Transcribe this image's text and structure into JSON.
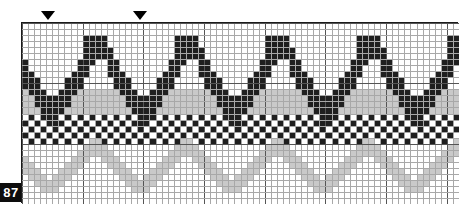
{
  "document": {
    "kind": "cross-stitch-pattern-chart",
    "page_badge": "87"
  },
  "chart_frame": {
    "x": 21,
    "y": 22,
    "width": 437,
    "height": 181,
    "columns": 72,
    "rows": 30,
    "cell_px": 6.07,
    "border_color": "#1a1a1a",
    "grid_line_color": "#a8a8a8",
    "heavy_line_color": "#555555",
    "heavy_every": 10,
    "background": "#ffffff"
  },
  "repeat_markers": [
    {
      "name": "repeat-marker-1",
      "x": 48,
      "column": 4
    },
    {
      "name": "repeat-marker-2",
      "x": 140,
      "column": 19
    }
  ],
  "palette": {
    "dark": "#1f1f1f",
    "mid": "#9a9a9a",
    "light": "#c9c9c9",
    "empty": "#ffffff"
  },
  "chart_data": {
    "type": "heatmap",
    "title": "",
    "xlabel": "",
    "ylabel": "",
    "columns": 72,
    "rows": 30,
    "legend": [
      {
        "symbol": "dark",
        "color": "#1f1f1f",
        "label": "dark floss"
      },
      {
        "symbol": "light",
        "color": "#c9c9c9",
        "label": "light floss"
      },
      {
        "symbol": "mid",
        "color": "#9a9a9a",
        "label": "medium floss"
      },
      {
        "symbol": "empty",
        "color": "#ffffff",
        "label": "unstitched"
      }
    ],
    "motifs": [
      {
        "name": "dark-chevron-wave",
        "color": "dark",
        "repeat_period": 15,
        "repeats": 5,
        "phase": -11,
        "band_top": 1,
        "band_bottom": 17,
        "peak_row": 2,
        "valley_row": 14,
        "stroke_rows": 3,
        "flat_top_cells": 3
      },
      {
        "name": "light-fill-band",
        "color": "light",
        "row_start": 11,
        "row_end": 14,
        "under_chevron": true
      },
      {
        "name": "dark-checker-band",
        "color": "dark",
        "row_start": 15,
        "row_end": 19,
        "checker_parity": 0
      },
      {
        "name": "light-zigzag-wave",
        "color": "light",
        "repeat_period": 15,
        "repeats": 5,
        "phase": -4,
        "peak_row": 19,
        "valley_row": 27,
        "stroke_rows": 2
      }
    ]
  }
}
